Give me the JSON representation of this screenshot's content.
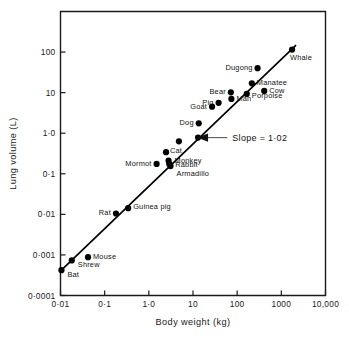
{
  "figure": {
    "name": "lung-volume-vs-body-weight-allometry",
    "background": "#ffffff",
    "ink_color": "#000000"
  },
  "chart_data": {
    "type": "scatter",
    "title": "",
    "subtitle": "",
    "xlabel": "Body weight  (kg)",
    "ylabel": "Lung volume  (L)",
    "xscale": "log",
    "yscale": "log",
    "xlim": [
      0.01,
      10000
    ],
    "ylim": [
      0.0001,
      1000
    ],
    "grid": false,
    "legend": null,
    "xticks": [
      0.01,
      0.1,
      1,
      10,
      100,
      1000,
      10000
    ],
    "xticklabels": [
      "0·01",
      "0·1",
      "1·0",
      "10",
      "100",
      "1000",
      "10,000"
    ],
    "yticks": [
      100,
      10,
      1,
      0.1,
      0.01,
      0.001,
      0.0001
    ],
    "yticklabels": [
      "100",
      "10",
      "1·0",
      "0·1",
      "0·01",
      "0·001",
      "0·0001"
    ],
    "marker": "filled-circle",
    "marker_size_px": 3.1,
    "annotations": [
      {
        "name": "slope-annotation",
        "text": "Slope = 1·02",
        "points_to_x": 13,
        "points_to_y": 0.78,
        "text_x": 70,
        "text_y": 0.78
      }
    ],
    "fit_line": {
      "name": "regression-line",
      "slope": 1.02,
      "x_start": 0.0105,
      "y_start": 0.00042,
      "x_end": 2100,
      "y_end": 145
    },
    "points": [
      {
        "label": "Bat",
        "x": 0.0105,
        "y": 0.00042,
        "label_dx": 6,
        "label_dy": 7,
        "anchor": "start"
      },
      {
        "label": "Shrew",
        "x": 0.018,
        "y": 0.00073,
        "label_dx": 6,
        "label_dy": 7,
        "anchor": "start"
      },
      {
        "label": "Mouse",
        "x": 0.042,
        "y": 0.00088,
        "label_dx": 5,
        "label_dy": 2,
        "anchor": "start"
      },
      {
        "label": "Rat",
        "x": 0.18,
        "y": 0.0105,
        "label_dx": -5,
        "label_dy": 2,
        "anchor": "end"
      },
      {
        "label": "Guinea pig",
        "x": 0.34,
        "y": 0.0142,
        "label_dx": 5,
        "label_dy": 1,
        "anchor": "start"
      },
      {
        "label": "Mormot",
        "x": 1.5,
        "y": 0.175,
        "label_dx": -5,
        "label_dy": 2,
        "anchor": "end"
      },
      {
        "label": "Cat",
        "x": 2.45,
        "y": 0.34,
        "label_dx": 4,
        "label_dy": 1,
        "anchor": "start"
      },
      {
        "label": "Monkey",
        "x": 2.8,
        "y": 0.21,
        "label_dx": 6,
        "label_dy": 2,
        "anchor": "start"
      },
      {
        "label": "Rabbit",
        "x": 2.9,
        "y": 0.175,
        "label_dx": 6,
        "label_dy": 3,
        "anchor": "start"
      },
      {
        "label": "Armadillo",
        "x": 3.1,
        "y": 0.155,
        "label_dx": 6,
        "label_dy": 10,
        "anchor": "start"
      },
      {
        "label": "",
        "x": 4.8,
        "y": 0.63,
        "label_dx": 0,
        "label_dy": 0,
        "anchor": "start"
      },
      {
        "label": "Dog",
        "x": 13.5,
        "y": 1.75,
        "label_dx": -5,
        "label_dy": 2,
        "anchor": "end"
      },
      {
        "label": "Goat",
        "x": 27,
        "y": 4.5,
        "label_dx": -5,
        "label_dy": 2,
        "anchor": "end"
      },
      {
        "label": "",
        "x": 13,
        "y": 0.78,
        "label_dx": 0,
        "label_dy": 0,
        "anchor": "start"
      },
      {
        "label": "Pig",
        "x": 38,
        "y": 5.6,
        "label_dx": -5,
        "label_dy": 2,
        "anchor": "end"
      },
      {
        "label": "Bear",
        "x": 72,
        "y": 10.2,
        "label_dx": -5,
        "label_dy": 2,
        "anchor": "end"
      },
      {
        "label": "Man",
        "x": 74,
        "y": 7.0,
        "label_dx": 5,
        "label_dy": 2,
        "anchor": "start"
      },
      {
        "label": "Porpoise",
        "x": 165,
        "y": 9.3,
        "label_dx": 5,
        "label_dy": 4,
        "anchor": "start"
      },
      {
        "label": "Manatee",
        "x": 215,
        "y": 17,
        "label_dx": 5,
        "label_dy": 2,
        "anchor": "start"
      },
      {
        "label": "Dugong",
        "x": 290,
        "y": 40,
        "label_dx": -5,
        "label_dy": 2,
        "anchor": "end"
      },
      {
        "label": "Cow",
        "x": 410,
        "y": 11,
        "label_dx": 5,
        "label_dy": 2,
        "anchor": "start"
      },
      {
        "label": "Whale",
        "x": 1750,
        "y": 115,
        "label_dx": -2,
        "label_dy": 10,
        "anchor": "start"
      }
    ]
  }
}
